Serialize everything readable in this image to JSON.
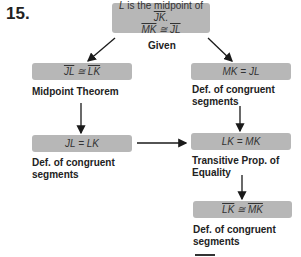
{
  "problem_number": "15.",
  "given": {
    "line1": "L is the midpoint of JK.",
    "line1_parts": {
      "pre": "L",
      "mid": " is the midpoint of ",
      "seg": "JK",
      "post": "."
    },
    "line2_parts": {
      "a": "MK",
      "op": " ≅ ",
      "b": "JL"
    },
    "reason": "Given"
  },
  "steps": [
    {
      "id": "left1",
      "statement_parts": {
        "a": "JL",
        "op": " ≅ ",
        "b": "LK"
      },
      "statement": "JL ≅ LK",
      "reason": "Midpoint Theorem"
    },
    {
      "id": "right1",
      "statement": "MK = JL",
      "reason_line1": "Def. of congruent",
      "reason_line2": "segments"
    },
    {
      "id": "left2",
      "statement": "JL = LK",
      "reason_line1": "Def. of congruent",
      "reason_line2": "segments"
    },
    {
      "id": "right2",
      "statement": "LK = MK",
      "reason_line1": "Transitive Prop. of",
      "reason_line2": "Equality"
    },
    {
      "id": "right3",
      "statement_parts": {
        "a": "LK",
        "op": " ≅ ",
        "b": "MK"
      },
      "statement": "LK ≅ MK",
      "reason_line1": "Def. of congruent",
      "reason_line2": "segments"
    }
  ],
  "colors": {
    "box": "#b7b7b7",
    "arrow": "#1a1a1a",
    "text": "#222222"
  }
}
